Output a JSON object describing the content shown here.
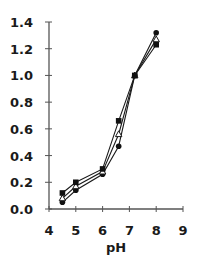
{
  "chart_data": {
    "type": "line",
    "title": "",
    "xlabel": "pH",
    "ylabel": "",
    "xlim": [
      4,
      9
    ],
    "ylim": [
      0.0,
      1.4
    ],
    "x_ticks": [
      "4",
      "5",
      "6",
      "7",
      "8",
      "9"
    ],
    "y_ticks": [
      "0.0",
      "0.2",
      "0.4",
      "0.6",
      "0.8",
      "1.0",
      "1.2",
      "1.4"
    ],
    "grid": false,
    "legend": null,
    "series": [
      {
        "name": "filled-circle",
        "marker": "circle-filled",
        "x": [
          4.5,
          5,
          6,
          6.6,
          7.2,
          8
        ],
        "values": [
          0.05,
          0.14,
          0.26,
          0.47,
          1.0,
          1.32
        ]
      },
      {
        "name": "open-triangle",
        "marker": "triangle-open",
        "x": [
          4.5,
          5,
          6,
          6.6,
          7.2,
          8
        ],
        "values": [
          0.08,
          0.17,
          0.28,
          0.56,
          1.0,
          1.27
        ]
      },
      {
        "name": "filled-square",
        "marker": "square-filled",
        "x": [
          4.5,
          5,
          6,
          6.6,
          7.2,
          8
        ],
        "values": [
          0.12,
          0.2,
          0.3,
          0.66,
          1.0,
          1.23
        ]
      }
    ]
  },
  "colors": {
    "line": "#1a1a1a",
    "axis": "#555555",
    "marker_fill": "#111111"
  }
}
